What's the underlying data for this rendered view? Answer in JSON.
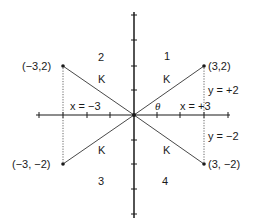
{
  "diagram": {
    "type": "coordinate-plane",
    "origin_px": [
      134,
      115
    ],
    "unit_x_px": 23.5,
    "unit_y_px": 24.5,
    "ticks": {
      "x": [
        -4,
        -3,
        -2,
        -1,
        1,
        2,
        3,
        4
      ],
      "y": [
        -4,
        -3,
        -2,
        -1,
        1,
        2,
        3,
        4
      ]
    },
    "points": [
      {
        "label": "(3,2)",
        "x": 3,
        "y": 2
      },
      {
        "label": "(−3,2)",
        "x": -3,
        "y": 2
      },
      {
        "label": "(−3, −2)",
        "x": -3,
        "y": -2
      },
      {
        "label": "(3, −2)",
        "x": 3,
        "y": -2
      }
    ],
    "quadrants": [
      "1",
      "2",
      "3",
      "4"
    ],
    "hypotenuse_label": "K",
    "angle_label": "θ",
    "x_labels": {
      "pos": "x = +3",
      "neg": "x = −3"
    },
    "y_labels": {
      "pos": "y = +2",
      "neg": "y = −2"
    },
    "colors": {
      "ink": "#1a1a1a",
      "dotted": "#555555"
    }
  }
}
